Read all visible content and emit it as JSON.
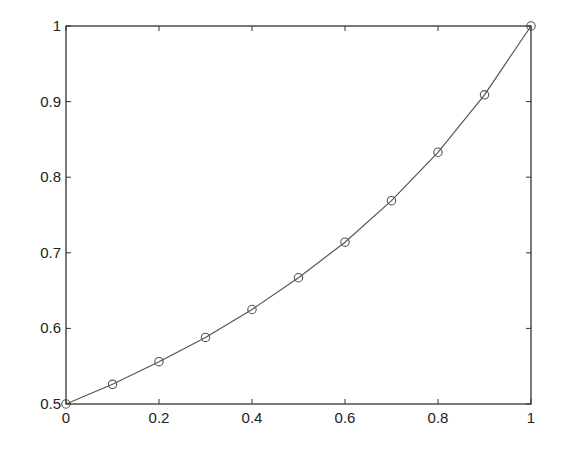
{
  "chart_data": {
    "type": "line",
    "title": "",
    "xlabel": "",
    "ylabel": "",
    "xlim": [
      0,
      1
    ],
    "ylim": [
      0.5,
      1
    ],
    "grid": false,
    "legend": null,
    "x_ticks": [
      0,
      0.2,
      0.4,
      0.6,
      0.8,
      1
    ],
    "x_tick_labels": [
      "0",
      "0.2",
      "0.4",
      "0.6",
      "0.8",
      "1"
    ],
    "y_ticks": [
      0.5,
      0.6,
      0.7,
      0.8,
      0.9,
      1
    ],
    "y_tick_labels": [
      "0.5",
      "0.6",
      "0.7",
      "0.8",
      "0.9",
      "1"
    ],
    "series": [
      {
        "name": "curve",
        "style": "solid line with circle markers",
        "color": "#555555",
        "x": [
          0,
          0.1,
          0.2,
          0.3,
          0.4,
          0.5,
          0.6,
          0.7,
          0.8,
          0.9,
          1.0
        ],
        "values": [
          0.5,
          0.526,
          0.556,
          0.588,
          0.625,
          0.667,
          0.714,
          0.769,
          0.833,
          0.909,
          1.0
        ]
      }
    ]
  },
  "colors": {
    "axes": "#333333",
    "line": "#555555",
    "marker": "#555555",
    "background": "#ffffff"
  }
}
